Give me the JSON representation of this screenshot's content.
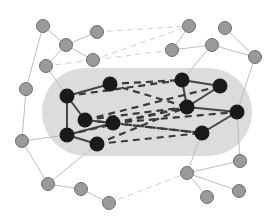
{
  "diagram": {
    "type": "network-graph",
    "colors": {
      "background": "#ffffff",
      "cluster_fill": "#dcdcdc",
      "core_node": "#1a1a1a",
      "peripheral_node": "#9a9a9a",
      "peripheral_stroke": "#6e6e6e",
      "core_edge": "#444444",
      "peripheral_edge": "#bdbdbd",
      "dashed_edge": "#3a3a3a",
      "light_dashed_edge": "#d0d0d0"
    },
    "cluster": {
      "x": 42,
      "y": 68,
      "width": 210,
      "height": 88,
      "rx": 44
    },
    "core_nodes": [
      {
        "id": "A",
        "x": 110,
        "y": 84
      },
      {
        "id": "B",
        "x": 67,
        "y": 96
      },
      {
        "id": "C",
        "x": 85,
        "y": 120
      },
      {
        "id": "D",
        "x": 113,
        "y": 123
      },
      {
        "id": "E",
        "x": 67,
        "y": 135
      },
      {
        "id": "F",
        "x": 97,
        "y": 144
      },
      {
        "id": "G",
        "x": 182,
        "y": 80
      },
      {
        "id": "H",
        "x": 220,
        "y": 86
      },
      {
        "id": "I",
        "x": 187,
        "y": 107
      },
      {
        "id": "J",
        "x": 237,
        "y": 112
      },
      {
        "id": "K",
        "x": 202,
        "y": 133
      }
    ],
    "peripheral_nodes": [
      {
        "id": "p1",
        "x": 43,
        "y": 26
      },
      {
        "id": "p2",
        "x": 97,
        "y": 32
      },
      {
        "id": "p3",
        "x": 66,
        "y": 45
      },
      {
        "id": "p4",
        "x": 93,
        "y": 60
      },
      {
        "id": "p5",
        "x": 46,
        "y": 66
      },
      {
        "id": "p6",
        "x": 26,
        "y": 89
      },
      {
        "id": "p7",
        "x": 189,
        "y": 26
      },
      {
        "id": "p8",
        "x": 225,
        "y": 28
      },
      {
        "id": "p9",
        "x": 172,
        "y": 50
      },
      {
        "id": "p10",
        "x": 212,
        "y": 45
      },
      {
        "id": "p11",
        "x": 255,
        "y": 57
      },
      {
        "id": "p12",
        "x": 22,
        "y": 141
      },
      {
        "id": "p13",
        "x": 48,
        "y": 184
      },
      {
        "id": "p14",
        "x": 81,
        "y": 189
      },
      {
        "id": "p15",
        "x": 109,
        "y": 203
      },
      {
        "id": "p16",
        "x": 240,
        "y": 161
      },
      {
        "id": "p17",
        "x": 187,
        "y": 173
      },
      {
        "id": "p18",
        "x": 239,
        "y": 191
      },
      {
        "id": "p19",
        "x": 207,
        "y": 197
      }
    ],
    "core_edges": [
      [
        "A",
        "B"
      ],
      [
        "B",
        "C"
      ],
      [
        "B",
        "E"
      ],
      [
        "E",
        "D"
      ],
      [
        "E",
        "F"
      ],
      [
        "C",
        "D"
      ],
      [
        "G",
        "H"
      ],
      [
        "G",
        "I"
      ],
      [
        "I",
        "J"
      ],
      [
        "H",
        "I"
      ],
      [
        "J",
        "K"
      ]
    ],
    "peripheral_edges": [
      [
        "p1",
        "p3"
      ],
      [
        "p3",
        "p2"
      ],
      [
        "p3",
        "p4"
      ],
      [
        "p1",
        "p6"
      ],
      [
        "p3",
        "p5"
      ],
      [
        "p5",
        "B"
      ],
      [
        "p6",
        "p12"
      ],
      [
        "p12",
        "E"
      ],
      [
        "p12",
        "p13"
      ],
      [
        "p13",
        "F"
      ],
      [
        "p13",
        "p14"
      ],
      [
        "p14",
        "p15"
      ],
      [
        "p7",
        "p9"
      ],
      [
        "p9",
        "p10"
      ],
      [
        "p10",
        "p11"
      ],
      [
        "p8",
        "p11"
      ],
      [
        "p10",
        "G"
      ],
      [
        "p11",
        "J"
      ],
      [
        "K",
        "p17"
      ],
      [
        "J",
        "p16"
      ],
      [
        "p17",
        "p16"
      ],
      [
        "p17",
        "p18"
      ],
      [
        "p17",
        "p19"
      ]
    ],
    "dashed_cross_edges": [
      [
        "A",
        "G"
      ],
      [
        "A",
        "I"
      ],
      [
        "B",
        "G"
      ],
      [
        "C",
        "H"
      ],
      [
        "C",
        "I"
      ],
      [
        "C",
        "K"
      ],
      [
        "D",
        "J"
      ],
      [
        "D",
        "I"
      ],
      [
        "D",
        "K"
      ],
      [
        "F",
        "K"
      ],
      [
        "F",
        "I"
      ],
      [
        "E",
        "I"
      ]
    ],
    "light_dashed_edges": [
      [
        "p2",
        "p7"
      ],
      [
        "p4",
        "p7"
      ],
      [
        "p15",
        "p17"
      ],
      [
        "p5",
        "p9"
      ]
    ]
  }
}
